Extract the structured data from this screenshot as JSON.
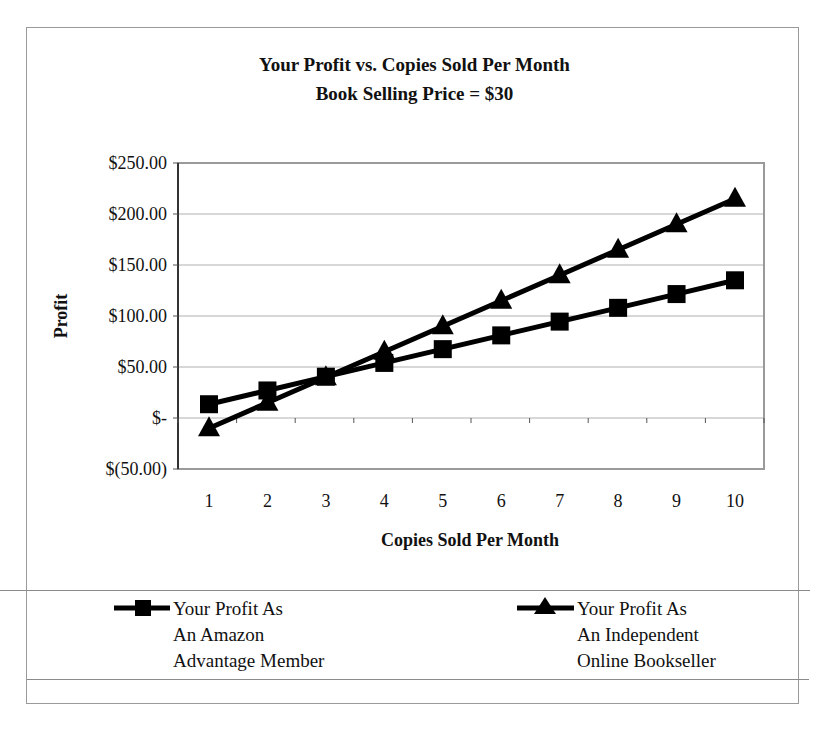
{
  "chart_data": {
    "type": "line",
    "title": "Your Profit vs. Copies Sold Per Month",
    "subtitle": "Book Selling Price = $30",
    "xlabel": "Copies Sold Per Month",
    "ylabel": "Profit",
    "x": [
      1,
      2,
      3,
      4,
      5,
      6,
      7,
      8,
      9,
      10
    ],
    "x_tick_labels": [
      "1",
      "2",
      "3",
      "4",
      "5",
      "6",
      "7",
      "8",
      "9",
      "10"
    ],
    "y_tick_labels": [
      "$250.00",
      "$200.00",
      "$150.00",
      "$100.00",
      "$50.00",
      "$-",
      "$(50.00)"
    ],
    "y_tick_values": [
      250,
      200,
      150,
      100,
      50,
      0,
      -50
    ],
    "ylim": [
      -50,
      250
    ],
    "grid": {
      "horizontal": true,
      "vertical": false
    },
    "legend_position": "bottom",
    "series": [
      {
        "name": "Your Profit As An Amazon Advantage Member",
        "marker": "square",
        "values": [
          13.5,
          27,
          40.5,
          54,
          67.5,
          81,
          94.5,
          108,
          121.5,
          135
        ]
      },
      {
        "name": "Your Profit As An Independent Online Bookseller",
        "marker": "triangle",
        "values": [
          -10,
          15,
          40,
          65,
          90,
          115,
          140,
          165,
          190,
          215
        ]
      }
    ]
  },
  "legend": [
    {
      "lines": [
        "Your Profit As",
        "An Amazon",
        "Advantage Member"
      ],
      "marker": "square"
    },
    {
      "lines": [
        "Your Profit As",
        "An Independent",
        "Online Bookseller"
      ],
      "marker": "triangle"
    }
  ],
  "colors": {
    "series": "#000000",
    "grid": "#b0b0b0",
    "frame": "#9a9a9a"
  }
}
